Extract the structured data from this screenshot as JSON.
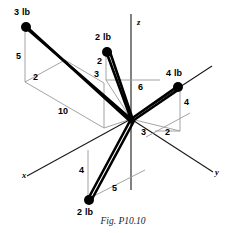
{
  "figure": {
    "caption": "Fig. P10.10",
    "axes": [
      {
        "name": "x",
        "label": "x"
      },
      {
        "name": "y",
        "label": "y"
      },
      {
        "name": "z",
        "label": "z"
      }
    ],
    "forces": [
      {
        "id": "force-3lb-upper-left",
        "label": "3 lb",
        "magnitude": 3,
        "unit": "lb"
      },
      {
        "id": "force-2lb-upper-middle",
        "label": "2 lb",
        "magnitude": 2,
        "unit": "lb"
      },
      {
        "id": "force-4lb-right",
        "label": "4 lb",
        "magnitude": 4,
        "unit": "lb"
      },
      {
        "id": "force-2lb-lower",
        "label": "2 lb",
        "magnitude": 2,
        "unit": "lb"
      }
    ],
    "dimensions": [
      {
        "id": "dim-5-upper-left",
        "value": "5"
      },
      {
        "id": "dim-2-upper-left",
        "value": "2"
      },
      {
        "id": "dim-10-left",
        "value": "10"
      },
      {
        "id": "dim-2-middle-top",
        "value": "2"
      },
      {
        "id": "dim-3-middle",
        "value": "3"
      },
      {
        "id": "dim-6-center",
        "value": "6"
      },
      {
        "id": "dim-4-right",
        "value": "4"
      },
      {
        "id": "dim-2-right-lower",
        "value": "2"
      },
      {
        "id": "dim-3-center-lower",
        "value": "3"
      },
      {
        "id": "dim-4-lower-left",
        "value": "4"
      },
      {
        "id": "dim-5-lower",
        "value": "5"
      }
    ],
    "colors": {
      "stroke": "#000000",
      "construction": "#9a9a9a",
      "axis": "#1a1a1a",
      "background": "#ffffff"
    }
  }
}
